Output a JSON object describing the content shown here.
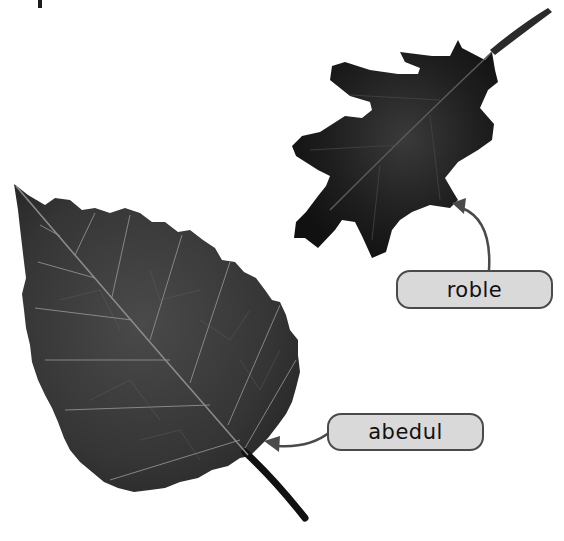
{
  "figure": {
    "leaves": [
      {
        "id": "oak",
        "label": "roble",
        "description": "dark lobed oak leaf, top right"
      },
      {
        "id": "birch",
        "label": "abedul",
        "description": "serrated birch leaf with visible veins, bottom left"
      }
    ],
    "labels": {
      "roble": "roble",
      "abedul": "abedul"
    },
    "colors": {
      "background": "#ffffff",
      "label_fill": "#d9d9d9",
      "label_border": "#4a4a4a",
      "arrow": "#4a4a4a",
      "leaf_dark": "#1e1e1e",
      "leaf_mid": "#3a3a3a",
      "vein": "#9a9a9a"
    }
  }
}
